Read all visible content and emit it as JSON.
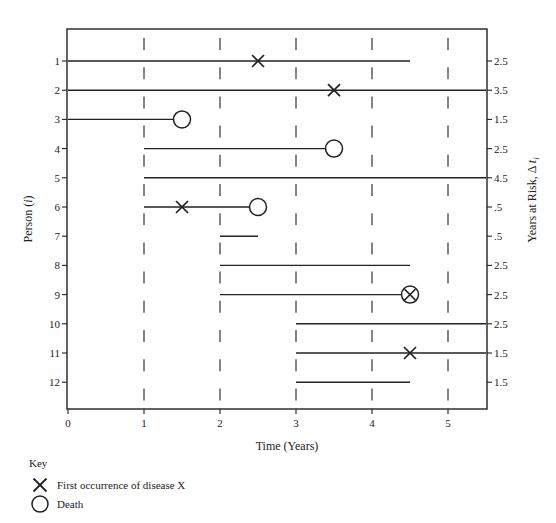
{
  "chart_data": {
    "type": "timeline",
    "title": "",
    "xlabel": "Time (Years)",
    "ylabel": "Person (i)",
    "ylabel_parts": {
      "text": "Person (",
      "italic": "i",
      "close": ")"
    },
    "right_ylabel": "Years at Risk, Δ t_i",
    "right_ylabel_parts": {
      "text": "Years at Risk, Δ ",
      "italic": "t",
      "sub": "i"
    },
    "xlim": [
      0,
      5.5
    ],
    "x_ticks": [
      "0",
      "1",
      "2",
      "3",
      "4",
      "5"
    ],
    "x_tick_values": [
      0,
      1,
      2,
      3,
      4,
      5
    ],
    "dashed_gridlines_at": [
      1,
      2,
      3,
      4,
      5
    ],
    "persons": [
      {
        "id": "1",
        "start": 0,
        "end": 4.5,
        "disease_at": 2.5,
        "death_at": null,
        "years_at_risk": "2.5"
      },
      {
        "id": "2",
        "start": 0,
        "end": 5.5,
        "disease_at": 3.5,
        "death_at": null,
        "years_at_risk": "3.5"
      },
      {
        "id": "3",
        "start": 0,
        "end": 1.5,
        "disease_at": null,
        "death_at": 1.5,
        "years_at_risk": "1.5"
      },
      {
        "id": "4",
        "start": 1,
        "end": 3.5,
        "disease_at": null,
        "death_at": 3.5,
        "years_at_risk": "2.5"
      },
      {
        "id": "5",
        "start": 1,
        "end": 5.5,
        "disease_at": null,
        "death_at": null,
        "years_at_risk": "4.5"
      },
      {
        "id": "6",
        "start": 1,
        "end": 2.5,
        "disease_at": 1.5,
        "death_at": 2.5,
        "years_at_risk": ".5"
      },
      {
        "id": "7",
        "start": 2,
        "end": 2.5,
        "disease_at": null,
        "death_at": null,
        "years_at_risk": ".5"
      },
      {
        "id": "8",
        "start": 2,
        "end": 4.5,
        "disease_at": null,
        "death_at": null,
        "years_at_risk": "2.5"
      },
      {
        "id": "9",
        "start": 2,
        "end": 4.5,
        "disease_at": 4.5,
        "death_at": 4.5,
        "years_at_risk": "2.5"
      },
      {
        "id": "10",
        "start": 3,
        "end": 5.5,
        "disease_at": null,
        "death_at": null,
        "years_at_risk": "2.5"
      },
      {
        "id": "11",
        "start": 3,
        "end": 5.5,
        "disease_at": 4.5,
        "death_at": null,
        "years_at_risk": "1.5"
      },
      {
        "id": "12",
        "start": 3,
        "end": 4.5,
        "disease_at": null,
        "death_at": null,
        "years_at_risk": "1.5"
      }
    ],
    "legend": {
      "title": "Key",
      "placement": "bottom-left",
      "entries": [
        {
          "symbol": "cross",
          "label": "First occurrence of disease X"
        },
        {
          "symbol": "circle",
          "label": "Death"
        }
      ]
    },
    "colors": {
      "ink": "#222222",
      "background": "#ffffff"
    }
  }
}
